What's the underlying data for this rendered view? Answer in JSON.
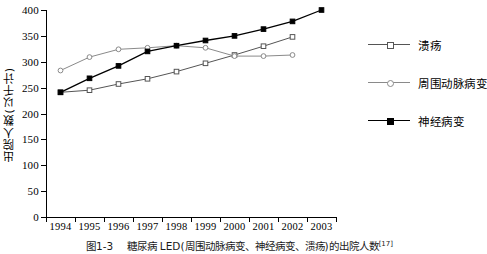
{
  "chart_data": {
    "type": "line",
    "title": "",
    "xlabel": "",
    "ylabel": "出院人数(以千计)",
    "categories": [
      "1994",
      "1995",
      "1996",
      "1997",
      "1998",
      "1999",
      "2000",
      "2001",
      "2002",
      "2003"
    ],
    "ylim": [
      0,
      400
    ],
    "yticks": [
      0,
      50,
      100,
      150,
      200,
      250,
      300,
      350,
      400
    ],
    "grid": false,
    "legend_position": "right",
    "series": [
      {
        "name": "溃疡",
        "marker": "open-square",
        "color": "#555555",
        "values": [
          241,
          245,
          257,
          267,
          281,
          297,
          313,
          330,
          348,
          null
        ]
      },
      {
        "name": "周围动脉病变",
        "marker": "open-circle",
        "color": "#8a8a8a",
        "values": [
          283,
          309,
          324,
          327,
          331,
          327,
          311,
          311,
          313,
          null
        ]
      },
      {
        "name": "神经病变",
        "marker": "filled-square",
        "color": "#000000",
        "values": [
          241,
          268,
          292,
          320,
          331,
          341,
          350,
          363,
          378,
          400
        ]
      }
    ]
  },
  "caption": {
    "number": "图1-3",
    "text": "糖尿病 LED(周围动脉病变、神经病变、溃疡)的出院人数",
    "ref": "[17]"
  }
}
